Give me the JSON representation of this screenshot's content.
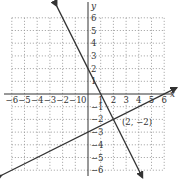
{
  "chart_data": {
    "type": "line",
    "title": "",
    "xlabel": "x",
    "ylabel": "y",
    "xlim": [
      -6,
      6
    ],
    "ylim": [
      -6,
      6
    ],
    "grid": true,
    "x_ticks": [
      "-6",
      "-5",
      "-4",
      "-3",
      "-2",
      "-1",
      "1",
      "2",
      "3",
      "4",
      "5",
      "6"
    ],
    "y_ticks": [
      "6",
      "5",
      "4",
      "3",
      "2",
      "1",
      "-1",
      "-2",
      "-3",
      "-4",
      "-5",
      "-6"
    ],
    "series": [
      {
        "name": "y = -2x + 2",
        "slope": -2,
        "intercept": 2,
        "color": "#333333"
      },
      {
        "name": "y = 0.5x - 3",
        "slope": 0.5,
        "intercept": -3,
        "color": "#333333"
      }
    ],
    "annotations": [
      {
        "text": "(2, −2)",
        "x": 2,
        "y": -2
      }
    ]
  },
  "labels": {
    "x_axis": "x",
    "y_axis": "y",
    "intersection": "(2, −2)",
    "origin": "0"
  }
}
